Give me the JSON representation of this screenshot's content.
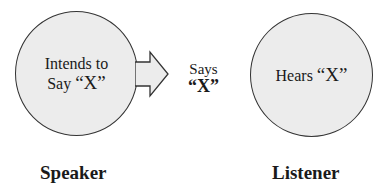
{
  "speaker": {
    "circle_line1": "Intends to",
    "circle_line2_prefix": "Say ",
    "circle_line2_quote": "“X”",
    "label": "Speaker"
  },
  "transmission": {
    "line1": "Says",
    "line2": "“X”",
    "arrow_icon": "right-arrow-icon"
  },
  "listener": {
    "circle_prefix": "Hears ",
    "circle_quote": "“X”",
    "label": "Listener"
  },
  "colors": {
    "circle_fill": "#ececec",
    "stroke": "#333333"
  }
}
